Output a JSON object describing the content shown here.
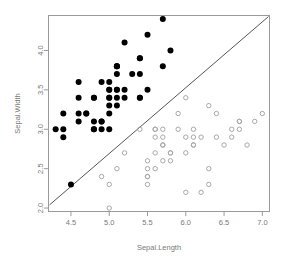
{
  "chart_data": {
    "type": "scatter",
    "title": "",
    "xlabel": "Sepal.Length",
    "ylabel": "Sepal.Width",
    "xlim": [
      4.2,
      7.1
    ],
    "ylim": [
      1.95,
      4.45
    ],
    "xticks": [
      4.5,
      5.0,
      5.5,
      6.0,
      6.5,
      7.0
    ],
    "yticks": [
      2.0,
      2.5,
      3.0,
      3.5,
      4.0
    ],
    "xtick_labels": [
      "4.5",
      "5.0",
      "5.5",
      "6.0",
      "6.5",
      "7.0"
    ],
    "ytick_labels": [
      "2.0",
      "2.5",
      "3.0",
      "3.5",
      "4.0"
    ],
    "grid": false,
    "legend": "none",
    "frame": true,
    "annotations": [
      {
        "name": "abline",
        "type": "line",
        "x": [
          4.22,
          7.08
        ],
        "y": [
          2.04,
          4.43
        ],
        "color": "#555555"
      }
    ],
    "series": [
      {
        "name": "setosa",
        "color": "#000000",
        "marker": "filled-circle",
        "marker_size": 3.0,
        "points": [
          [
            5.1,
            3.5
          ],
          [
            4.9,
            3.0
          ],
          [
            4.7,
            3.2
          ],
          [
            4.6,
            3.1
          ],
          [
            5.0,
            3.6
          ],
          [
            5.4,
            3.9
          ],
          [
            4.6,
            3.4
          ],
          [
            5.0,
            3.4
          ],
          [
            4.4,
            2.9
          ],
          [
            4.9,
            3.1
          ],
          [
            5.4,
            3.7
          ],
          [
            4.8,
            3.4
          ],
          [
            4.8,
            3.0
          ],
          [
            4.3,
            3.0
          ],
          [
            5.8,
            4.0
          ],
          [
            5.7,
            4.4
          ],
          [
            5.4,
            3.9
          ],
          [
            5.1,
            3.5
          ],
          [
            5.7,
            3.8
          ],
          [
            5.1,
            3.8
          ],
          [
            5.4,
            3.4
          ],
          [
            5.1,
            3.7
          ],
          [
            4.6,
            3.6
          ],
          [
            5.1,
            3.3
          ],
          [
            4.8,
            3.4
          ],
          [
            5.0,
            3.0
          ],
          [
            5.0,
            3.4
          ],
          [
            5.2,
            3.5
          ],
          [
            5.2,
            3.4
          ],
          [
            4.7,
            3.2
          ],
          [
            4.8,
            3.1
          ],
          [
            5.4,
            3.4
          ],
          [
            5.2,
            4.1
          ],
          [
            5.5,
            4.2
          ],
          [
            4.9,
            3.1
          ],
          [
            5.0,
            3.2
          ],
          [
            5.5,
            3.5
          ],
          [
            4.9,
            3.6
          ],
          [
            4.4,
            3.0
          ],
          [
            5.1,
            3.4
          ],
          [
            5.0,
            3.5
          ],
          [
            4.5,
            2.3
          ],
          [
            4.4,
            3.2
          ],
          [
            5.0,
            3.5
          ],
          [
            5.1,
            3.8
          ],
          [
            4.8,
            3.0
          ],
          [
            5.1,
            3.8
          ],
          [
            4.6,
            3.2
          ],
          [
            5.3,
            3.7
          ],
          [
            5.0,
            3.3
          ]
        ]
      },
      {
        "name": "versicolor",
        "color": "#a8a8a8",
        "marker": "open-circle",
        "marker_size": 2.2,
        "points": [
          [
            7.0,
            3.2
          ],
          [
            6.4,
            3.2
          ],
          [
            6.9,
            3.1
          ],
          [
            5.5,
            2.3
          ],
          [
            6.5,
            2.8
          ],
          [
            5.7,
            2.8
          ],
          [
            6.3,
            3.3
          ],
          [
            4.9,
            2.4
          ],
          [
            6.6,
            2.9
          ],
          [
            5.2,
            2.7
          ],
          [
            5.0,
            2.0
          ],
          [
            5.9,
            3.0
          ],
          [
            6.0,
            2.2
          ],
          [
            6.1,
            2.9
          ],
          [
            5.6,
            2.9
          ],
          [
            6.7,
            3.1
          ],
          [
            5.6,
            3.0
          ],
          [
            5.8,
            2.7
          ],
          [
            6.2,
            2.2
          ],
          [
            5.6,
            2.5
          ],
          [
            5.9,
            3.2
          ],
          [
            6.1,
            2.8
          ],
          [
            6.3,
            2.5
          ],
          [
            6.1,
            2.8
          ],
          [
            6.4,
            2.9
          ],
          [
            6.6,
            3.0
          ],
          [
            6.8,
            2.8
          ],
          [
            6.7,
            3.0
          ],
          [
            6.0,
            2.9
          ],
          [
            5.7,
            2.6
          ],
          [
            5.5,
            2.4
          ],
          [
            5.5,
            2.4
          ],
          [
            5.8,
            2.7
          ],
          [
            6.0,
            2.7
          ],
          [
            5.4,
            3.0
          ],
          [
            6.0,
            3.4
          ],
          [
            6.7,
            3.1
          ],
          [
            6.3,
            2.3
          ],
          [
            5.6,
            3.0
          ],
          [
            5.5,
            2.5
          ],
          [
            5.5,
            2.6
          ],
          [
            6.1,
            3.0
          ],
          [
            5.8,
            2.6
          ],
          [
            5.0,
            2.3
          ],
          [
            5.6,
            2.7
          ],
          [
            5.7,
            3.0
          ],
          [
            5.7,
            2.9
          ],
          [
            6.2,
            2.9
          ],
          [
            5.1,
            2.5
          ],
          [
            5.7,
            2.8
          ]
        ]
      }
    ]
  },
  "axes": {
    "x_title": "Sepal.Length",
    "y_title": "Sepal.Width"
  },
  "colors": {
    "setosa": "#000000",
    "versicolor": "#a8a8a8",
    "frame": "#9a9a9a",
    "abline": "#555555",
    "text": "#7a7a7a",
    "background": "#ffffff"
  }
}
